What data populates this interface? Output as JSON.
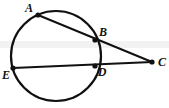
{
  "figure": {
    "type": "circle-geometry-diagram",
    "width": 169,
    "height": 108,
    "background_color": "#ffffff",
    "stroke_color": "#111111",
    "band_color": "#f2f2f2",
    "circle": {
      "cx": 56,
      "cy": 56,
      "r": 45,
      "stroke_width": 2.2
    },
    "points": [
      {
        "id": "A",
        "label": "A",
        "x": 38,
        "y": 15,
        "label_x": 29,
        "label_y": 8,
        "dot_r": 2.6
      },
      {
        "id": "B",
        "label": "B",
        "x": 95,
        "y": 40,
        "label_x": 103,
        "label_y": 32,
        "dot_r": 2.6
      },
      {
        "id": "C",
        "label": "C",
        "x": 152,
        "y": 62,
        "label_x": 162,
        "label_y": 62,
        "dot_r": 2.6
      },
      {
        "id": "D",
        "label": "D",
        "x": 95,
        "y": 66,
        "label_x": 102,
        "label_y": 72,
        "dot_r": 2.6
      },
      {
        "id": "E",
        "label": "E",
        "x": 13,
        "y": 68,
        "label_x": 6,
        "label_y": 75,
        "dot_r": 2.6
      }
    ],
    "segments": [
      {
        "id": "AC",
        "from": "A",
        "to": "C",
        "x1": 38,
        "y1": 15,
        "x2": 152,
        "y2": 62,
        "stroke_width": 2.0
      },
      {
        "id": "EC",
        "from": "E",
        "to": "C",
        "x1": 13,
        "y1": 68,
        "x2": 152,
        "y2": 62,
        "stroke_width": 2.0
      }
    ],
    "band": {
      "y": 41,
      "height": 7
    }
  }
}
